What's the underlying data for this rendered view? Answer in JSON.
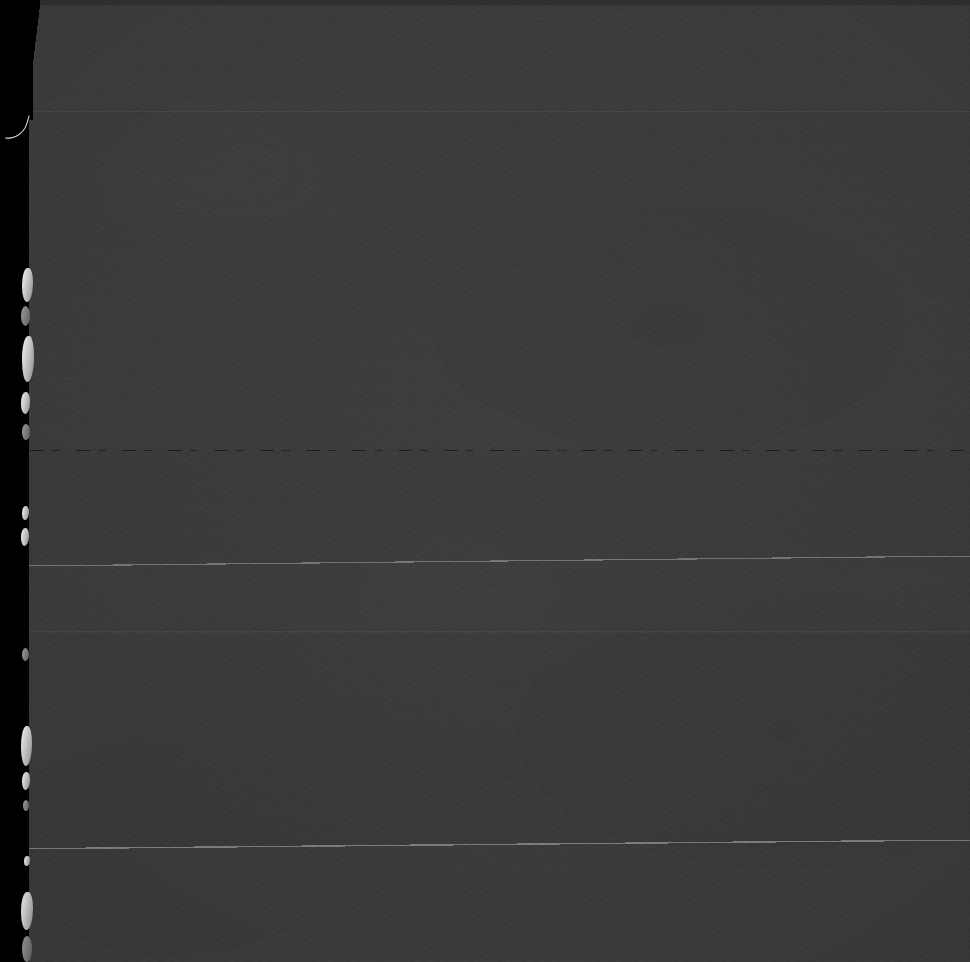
{
  "frame": {
    "label": "scanned-document-frame",
    "width": 970,
    "height": 962,
    "caption": "Dark underexposed microfilm scan of a blank page",
    "alt_text": "A nearly uniform dark grey scanned page with a black border strip and torn paper edge along the left side"
  },
  "colors": {
    "border_black": "#000000",
    "paper_dark": "#3a3a3a",
    "paper_band_top": "#3b3b3b",
    "paper_band_mid": "#393939",
    "top_edge_band": "#2f2f2f",
    "edge_highlight": "#f2f2f2",
    "seam_light": "#ffffff",
    "seam_dark": "#000000"
  },
  "regions": {
    "left_border": {
      "name": "left-black-border",
      "x": 0,
      "y": 0,
      "width": 29,
      "height": 962
    },
    "paper_field": {
      "name": "paper-field",
      "x": 28,
      "y": 0,
      "width": 942,
      "height": 962
    }
  },
  "artifacts": {
    "top_edge_band": {
      "name": "top-edge-band",
      "y": 0,
      "height": 5
    },
    "seams": [
      {
        "name": "seam-line-upper",
        "y": 111,
        "tone": "light",
        "opacity": 0.06
      },
      {
        "name": "seam-line-dashed",
        "y": 450,
        "tone": "dark",
        "opacity": 0.55
      },
      {
        "name": "seam-line-sloped-upper",
        "y": 560,
        "tone": "light",
        "opacity": 0.3
      },
      {
        "name": "seam-line-faint",
        "y": 631,
        "tone": "light",
        "opacity": 0.055
      },
      {
        "name": "seam-line-sloped-lower",
        "y": 845,
        "tone": "light",
        "opacity": 0.34
      }
    ],
    "torn_edge_highlights": [
      {
        "name": "edge-highlight-1",
        "x": 22,
        "y": 268,
        "width": 11,
        "height": 34
      },
      {
        "name": "edge-highlight-2",
        "x": 21,
        "y": 306,
        "width": 9,
        "height": 20
      },
      {
        "name": "edge-highlight-3",
        "x": 22,
        "y": 336,
        "width": 12,
        "height": 46
      },
      {
        "name": "edge-highlight-4",
        "x": 21,
        "y": 392,
        "width": 9,
        "height": 22
      },
      {
        "name": "edge-highlight-5",
        "x": 22,
        "y": 424,
        "width": 8,
        "height": 16
      },
      {
        "name": "edge-highlight-6",
        "x": 22,
        "y": 506,
        "width": 7,
        "height": 14
      },
      {
        "name": "edge-highlight-7",
        "x": 21,
        "y": 528,
        "width": 8,
        "height": 18
      },
      {
        "name": "edge-highlight-8",
        "x": 22,
        "y": 648,
        "width": 7,
        "height": 13
      },
      {
        "name": "edge-highlight-9",
        "x": 21,
        "y": 726,
        "width": 11,
        "height": 40
      },
      {
        "name": "edge-highlight-10",
        "x": 22,
        "y": 772,
        "width": 8,
        "height": 18
      },
      {
        "name": "edge-highlight-11",
        "x": 23,
        "y": 800,
        "width": 6,
        "height": 11
      },
      {
        "name": "edge-highlight-12",
        "x": 24,
        "y": 856,
        "width": 6,
        "height": 10
      },
      {
        "name": "edge-highlight-13",
        "x": 21,
        "y": 892,
        "width": 12,
        "height": 38
      },
      {
        "name": "edge-highlight-14",
        "x": 22,
        "y": 936,
        "width": 10,
        "height": 26
      }
    ],
    "hair_filament": {
      "name": "hair-filament-artifact",
      "x": 6,
      "y": 116,
      "width": 28,
      "height": 26
    }
  }
}
